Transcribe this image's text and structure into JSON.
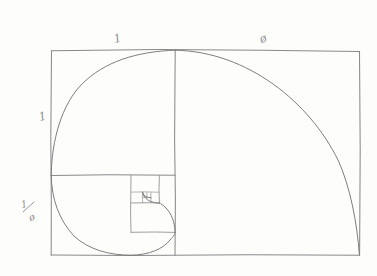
{
  "document": {
    "title": "Golden Ratio Spiral Sketch",
    "medium": "pencil on paper",
    "background_color": "#fdfdfc",
    "ink_color": "#8a8a8a"
  },
  "labels": {
    "top_left": "1",
    "top_right": "ø",
    "left_side": "1",
    "bottom_left_numerator": "1",
    "bottom_left_denominator": "ø"
  },
  "figure": {
    "outer_rectangle": {
      "name": "golden-rectangle",
      "x": 51,
      "y": 50,
      "width": 309,
      "height": 205
    },
    "divider_vertical_x": 175,
    "divider_horizontal_y": 175,
    "unit_square": {
      "x": 51,
      "y": 50,
      "width": 124,
      "height": 125
    },
    "nested_squares": [
      {
        "name": "square-1",
        "x": 51,
        "y": 50,
        "size": 124
      },
      {
        "name": "square-2",
        "x": 51,
        "y": 175,
        "size": 80
      },
      {
        "name": "square-3",
        "x": 131,
        "y": 175,
        "size": 44
      },
      {
        "name": "square-4",
        "x": 131,
        "y": 175,
        "size": 28
      },
      {
        "name": "square-5",
        "x": 124,
        "y": 190,
        "size": 17
      },
      {
        "name": "square-6",
        "x": 124,
        "y": 190,
        "size": 10
      }
    ],
    "spiral_description": "quarter-arc fibonacci spiral from outer rectangle corner inward to center"
  }
}
